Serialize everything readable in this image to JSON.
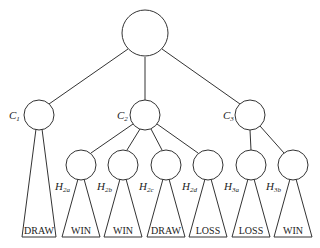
{
  "diagram": {
    "type": "game-tree",
    "root": {
      "id": "root",
      "label": ""
    },
    "level1": [
      {
        "id": "C1",
        "label": "C",
        "sub": "1"
      },
      {
        "id": "C2",
        "label": "C",
        "sub": "2"
      },
      {
        "id": "C3",
        "label": "C",
        "sub": "3"
      }
    ],
    "level2": [
      {
        "id": "H2a",
        "parent": "C2",
        "label": "H",
        "sub": "2a"
      },
      {
        "id": "H2b",
        "parent": "C2",
        "label": "H",
        "sub": "2b"
      },
      {
        "id": "H2c",
        "parent": "C2",
        "label": "H",
        "sub": "2c"
      },
      {
        "id": "H2d",
        "parent": "C2",
        "label": "H",
        "sub": "2d"
      },
      {
        "id": "H3a",
        "parent": "C3",
        "label": "H",
        "sub": "3a"
      },
      {
        "id": "H3b",
        "parent": "C3",
        "label": "H",
        "sub": "3b"
      }
    ],
    "outcomes": [
      {
        "node": "C1",
        "result": "DRAW"
      },
      {
        "node": "H2a",
        "result": "WIN"
      },
      {
        "node": "H2b",
        "result": "WIN"
      },
      {
        "node": "H2c",
        "result": "DRAW"
      },
      {
        "node": "H2d",
        "result": "LOSS"
      },
      {
        "node": "H3a",
        "result": "LOSS"
      },
      {
        "node": "H3b",
        "result": "WIN"
      }
    ]
  }
}
